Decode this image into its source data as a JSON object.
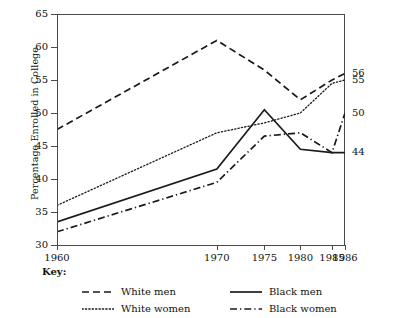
{
  "chart_data": {
    "type": "line",
    "title": "",
    "xlabel": "",
    "ylabel": "Percentage Enrolled in College",
    "x": [
      "1960",
      "1970",
      "1975",
      "1980",
      "1985",
      "1986"
    ],
    "x_positions": [
      0,
      0.555,
      0.72,
      0.845,
      0.955,
      1.0
    ],
    "ylim": [
      30,
      65
    ],
    "yticks": [
      30,
      35,
      40,
      45,
      50,
      55,
      60,
      65
    ],
    "ytick_labels": [
      "30",
      "35",
      "40",
      "45",
      "50",
      "55",
      "60",
      "65"
    ],
    "xtick_labels": [
      "1960",
      "1970",
      "1975",
      "1980",
      "1985",
      "1986"
    ],
    "grid": false,
    "legend_position": "below-plot",
    "legend_title": "Key:",
    "series": [
      {
        "name": "White men",
        "style": "dashed",
        "color": "#1a1a1a",
        "values": [
          47.5,
          61,
          56.5,
          52,
          55,
          56
        ],
        "end_label": "56"
      },
      {
        "name": "White women",
        "style": "dotted",
        "color": "#1a1a1a",
        "values": [
          36,
          47,
          48.5,
          50,
          54.5,
          55
        ],
        "end_label": "55"
      },
      {
        "name": "Black men",
        "style": "solid",
        "color": "#1a1a1a",
        "values": [
          33.5,
          41.5,
          50.5,
          44.5,
          44,
          44
        ],
        "end_label": "44"
      },
      {
        "name": "Black women",
        "style": "dashdot",
        "color": "#1a1a1a",
        "values": [
          32,
          39.5,
          46.5,
          47,
          44,
          50
        ],
        "end_label": "50"
      }
    ],
    "end_labels": [
      {
        "text": "56",
        "value": 56
      },
      {
        "text": "55",
        "value": 55
      },
      {
        "text": "50",
        "value": 50
      },
      {
        "text": "44",
        "value": 44
      }
    ]
  },
  "legend": {
    "title": "Key:",
    "entries": [
      {
        "label": "White men",
        "style": "dashed"
      },
      {
        "label": "Black men",
        "style": "solid"
      },
      {
        "label": "White women",
        "style": "dotted"
      },
      {
        "label": "Black women",
        "style": "dashdot"
      }
    ]
  }
}
